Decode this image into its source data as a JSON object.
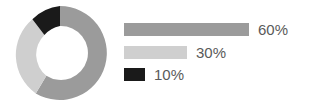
{
  "chart_data": {
    "type": "pie",
    "title": "",
    "subtitle": "",
    "variant": "donut",
    "labels": [
      "60%",
      "30%",
      "10%"
    ],
    "values": [
      60,
      30,
      10
    ],
    "colors": [
      "#9b9b9b",
      "#cfcfcf",
      "#1a1a1a"
    ],
    "legend_position": "right",
    "legend_style": "horizontal-bars",
    "grid": false,
    "xlabel": "",
    "ylabel": "",
    "donut": {
      "outer_radius": 47,
      "inner_radius": 20,
      "start_angle_deg": 0,
      "direction": "clockwise",
      "center_x": 47,
      "center_y": 49
    },
    "legend_bars": {
      "max_bar_width": 125,
      "bar_height": 13,
      "bar_widths": [
        125,
        63,
        21
      ]
    }
  },
  "legend": {
    "items": [
      {
        "label": "60%",
        "value": 60,
        "color": "#9b9b9b",
        "bar_width": "125px"
      },
      {
        "label": "30%",
        "value": 30,
        "color": "#cfcfcf",
        "bar_width": "63px"
      },
      {
        "label": "10%",
        "value": 10,
        "color": "#1a1a1a",
        "bar_width": "21px"
      }
    ]
  },
  "canvas": {
    "background": "#ffffff",
    "text_color": "#5a5a5a"
  }
}
